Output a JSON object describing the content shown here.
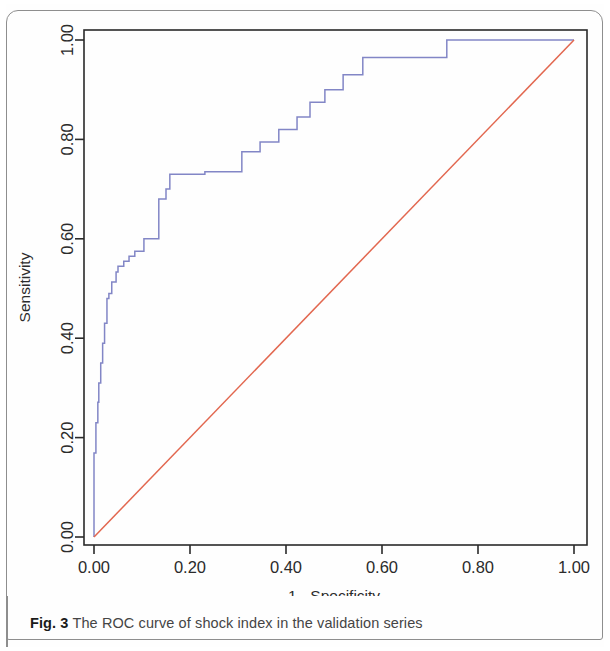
{
  "figure": {
    "caption_label": "Fig. 3",
    "caption_text": "The ROC curve of shock index in the validation series"
  },
  "chart_data": {
    "type": "line",
    "title": "",
    "xlabel": "1 - Specificity",
    "ylabel": "Sensitivity",
    "xlim": [
      0.0,
      1.0
    ],
    "ylim": [
      0.0,
      1.0
    ],
    "xticks": [
      "0.00",
      "0.20",
      "0.40",
      "0.60",
      "0.80",
      "1.00"
    ],
    "xtick_values": [
      0.0,
      0.2,
      0.4,
      0.6,
      0.8,
      1.0
    ],
    "yticks": [
      "0.00",
      "0.20",
      "0.40",
      "0.60",
      "0.80",
      "1.00"
    ],
    "ytick_values": [
      0.0,
      0.2,
      0.4,
      0.6,
      0.8,
      1.0
    ],
    "grid": false,
    "legend": "none",
    "series": [
      {
        "name": "ROC curve",
        "color": "#8286c6",
        "style": "step",
        "x": [
          0.0,
          0.0,
          0.004,
          0.004,
          0.008,
          0.008,
          0.01,
          0.01,
          0.014,
          0.014,
          0.018,
          0.018,
          0.022,
          0.022,
          0.027,
          0.027,
          0.031,
          0.031,
          0.037,
          0.037,
          0.046,
          0.046,
          0.05,
          0.05,
          0.062,
          0.062,
          0.073,
          0.073,
          0.085,
          0.085,
          0.104,
          0.104,
          0.135,
          0.135,
          0.15,
          0.15,
          0.158,
          0.158,
          0.231,
          0.231,
          0.308,
          0.308,
          0.346,
          0.346,
          0.385,
          0.385,
          0.423,
          0.423,
          0.45,
          0.45,
          0.481,
          0.481,
          0.519,
          0.519,
          0.56,
          0.56,
          0.735,
          0.735,
          1.0
        ],
        "y": [
          0.0,
          0.169,
          0.169,
          0.23,
          0.23,
          0.271,
          0.271,
          0.31,
          0.31,
          0.35,
          0.35,
          0.39,
          0.39,
          0.43,
          0.43,
          0.48,
          0.48,
          0.49,
          0.49,
          0.513,
          0.513,
          0.533,
          0.533,
          0.545,
          0.545,
          0.555,
          0.555,
          0.565,
          0.565,
          0.575,
          0.575,
          0.6,
          0.6,
          0.68,
          0.68,
          0.7,
          0.7,
          0.73,
          0.73,
          0.735,
          0.735,
          0.775,
          0.775,
          0.795,
          0.795,
          0.82,
          0.82,
          0.845,
          0.845,
          0.875,
          0.875,
          0.9,
          0.9,
          0.93,
          0.93,
          0.965,
          0.965,
          1.0,
          1.0
        ]
      },
      {
        "name": "Reference diagonal",
        "color": "#e2674f",
        "style": "line",
        "x": [
          0.0,
          1.0
        ],
        "y": [
          0.0,
          1.0
        ]
      }
    ]
  }
}
